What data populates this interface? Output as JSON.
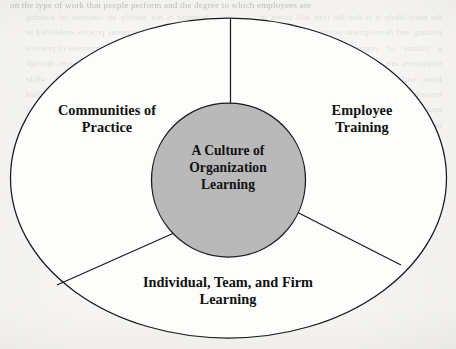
{
  "figure": {
    "kind": "concentric-venn-pie-diagram",
    "center_node": {
      "label": "A Culture of\nOrganization\nLearning",
      "fill_color": "#b9b9b9",
      "stroke_color": "#1a1a1a"
    },
    "outer_ring": {
      "fill_color": "#fdfdfc",
      "stroke_color": "#1a1a1a"
    },
    "segments": [
      {
        "id": "communities-of-practice",
        "label": "Communities of\nPractice"
      },
      {
        "id": "employee-training",
        "label": "Employee\nTraining"
      },
      {
        "id": "individual-team-firm-learning",
        "label": "Individual, Team, and Firm\nLearning"
      }
    ]
  },
  "page": {
    "top_strip_text": "on the type of work that people perform and the degree to which employees are",
    "ghost_left": "the more likely it is that the firm will invest in training and development activities that support a culture of organization learning. When employees are encouraged to share what they know with others, and when the organization rewards such sharing, communities of practice emerge and individual, team, and firm learning becomes part of the everyday fabric of the organization. Research suggests that firms with strong learning cultures outperform their rivals over the long term, in part because the knowledge created inside the firm is difficult for competitors to imitate.",
    "ghost_right": "learning is not merely an outcome of training programs but a continuous process embedded in the routines of the firm. Communities of practice provide the informal social structures through which tacit knowledge is transferred, while formal employee training supplies the codified knowledge base. Together these elements reinforce one another, producing the virtuous cycle depicted in the figure below, in which each component strengthens the others over time."
  }
}
